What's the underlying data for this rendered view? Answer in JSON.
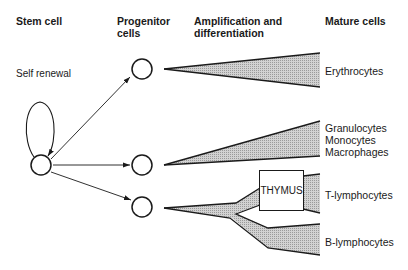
{
  "headers": {
    "stem_cell": "Stem cell",
    "progenitor_line1": "Progenitor",
    "progenitor_line2": "cells",
    "amplification_line1": "Amplification and",
    "amplification_line2": "differentiation",
    "mature_cells": "Mature cells"
  },
  "self_renewal_label": "Self renewal",
  "thymus_label": "THYMUS",
  "mature_cell_types": {
    "erythrocytes": "Erythrocytes",
    "granulocytes": "Granulocytes",
    "monocytes": "Monocytes",
    "macrophages": "Macrophages",
    "t_lymphocytes": "T-lymphocytes",
    "b_lymphocytes": "B-lymphocytes"
  },
  "colors": {
    "line": "#1a1a1a",
    "wedge_fill": "#c4c4c4",
    "background": "#ffffff"
  }
}
